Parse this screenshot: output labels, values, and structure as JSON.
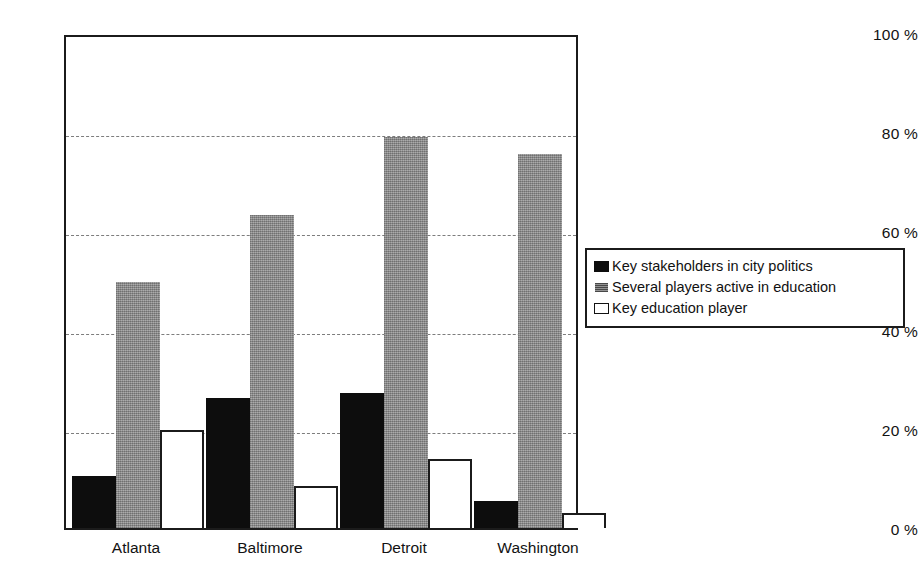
{
  "chart_data": {
    "type": "bar",
    "title": "",
    "subtitle": "",
    "xlabel": "",
    "ylabel": "",
    "grid": true,
    "legend_position": "right",
    "ylim": [
      0,
      100
    ],
    "ytick_labels": [
      "100 %",
      "80 %",
      "60 %",
      "40 %",
      "20 %",
      "0 %"
    ],
    "ytick_values": [
      100,
      80,
      60,
      40,
      20,
      0
    ],
    "gridline_values": [
      80,
      60,
      40,
      20
    ],
    "categories": [
      "Atlanta",
      "Baltimore",
      "Detroit",
      "Washington"
    ],
    "series": [
      {
        "name": "Key stakeholders in city politics",
        "color": "#0d0d0d",
        "values": [
          10.5,
          26.3,
          27.2,
          5.5
        ]
      },
      {
        "name": "Several players active in education",
        "color": "#9a9a9a",
        "values": [
          49.8,
          63.2,
          79.0,
          75.5
        ]
      },
      {
        "name": "Key education player",
        "color": "#ffffff",
        "values": [
          19.8,
          8.5,
          14.0,
          3.0
        ]
      }
    ]
  },
  "legend": {
    "items": [
      {
        "label": "Key stakeholders in city politics",
        "swatch": "black-filled-swatch"
      },
      {
        "label": "Several players active in education",
        "swatch": "gray-hatched-swatch"
      },
      {
        "label": "Key education player",
        "swatch": "white-outlined-swatch"
      }
    ]
  },
  "axes": {
    "y_labels": [
      "100 %",
      "80 %",
      "60 %",
      "40 %",
      "20 %",
      "0 %"
    ],
    "x_labels": [
      "Atlanta",
      "Baltimore",
      "Detroit",
      "Washington"
    ]
  }
}
